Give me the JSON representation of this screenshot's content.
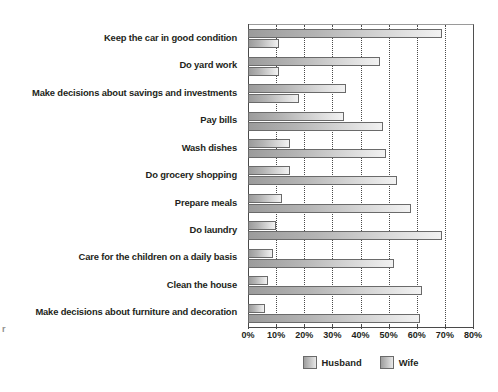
{
  "artifact": {
    "mark": "r"
  },
  "legend": {
    "position": "bottom-center",
    "items": [
      {
        "label": "Husband",
        "swatch_name": "legend-swatch-husband"
      },
      {
        "label": "Wife",
        "swatch_name": "legend-swatch-wife"
      }
    ]
  },
  "axis": {
    "ticks": [
      "0%",
      "10%",
      "20%",
      "30%",
      "40%",
      "50%",
      "60%",
      "70%",
      "80%"
    ]
  },
  "chart_data": {
    "type": "bar",
    "orientation": "horizontal",
    "title": "",
    "subtitle": "",
    "xlabel": "",
    "ylabel": "",
    "xlim": [
      0,
      80
    ],
    "xtick_values": [
      0,
      10,
      20,
      30,
      40,
      50,
      60,
      70,
      80
    ],
    "xtick_labels": [
      "0%",
      "10%",
      "20%",
      "30%",
      "40%",
      "50%",
      "60%",
      "70%",
      "80%"
    ],
    "grid": "vertical-dotted",
    "legend_position": "bottom-center",
    "categories": [
      "Keep the car in good condition",
      "Do yard work",
      "Make decisions about savings and investments",
      "Pay bills",
      "Wash dishes",
      "Do grocery shopping",
      "Prepare meals",
      "Do laundry",
      "Care for the children on a daily basis",
      "Clean the house",
      "Make decisions about furniture and decoration"
    ],
    "series": [
      {
        "name": "Husband",
        "values": [
          69,
          47,
          35,
          34,
          15,
          15,
          12,
          10,
          9,
          7,
          6
        ]
      },
      {
        "name": "Wife",
        "values": [
          11,
          11,
          18,
          48,
          49,
          53,
          58,
          69,
          52,
          62,
          61
        ]
      }
    ]
  }
}
